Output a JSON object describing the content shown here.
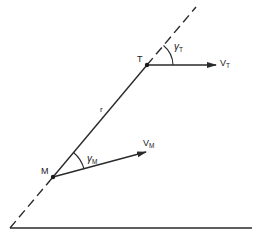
{
  "diagram": {
    "title": "",
    "points": {
      "T": {
        "label": "T",
        "x": 147,
        "y": 65
      },
      "M": {
        "label": "M",
        "x": 53,
        "y": 177
      }
    },
    "line_of_sight": {
      "label": "r",
      "start": [
        10,
        228
      ],
      "end": [
        196,
        7
      ]
    },
    "vectors": {
      "target_velocity": {
        "label": "V",
        "subscript": "T",
        "from": [
          147,
          65
        ],
        "to": [
          216,
          65
        ]
      },
      "missile_velocity": {
        "label": "V",
        "subscript": "M",
        "from": [
          53,
          177
        ],
        "to": [
          146,
          152
        ]
      }
    },
    "angles": {
      "gamma_T": {
        "symbol": "γ",
        "subscript": "T"
      },
      "gamma_M": {
        "symbol": "γ",
        "subscript": "M"
      }
    },
    "reference_line": {
      "start": [
        10,
        228
      ],
      "end": [
        252,
        228
      ]
    },
    "colors": {
      "stroke": "#2a2a2a",
      "background": "#ffffff"
    }
  }
}
